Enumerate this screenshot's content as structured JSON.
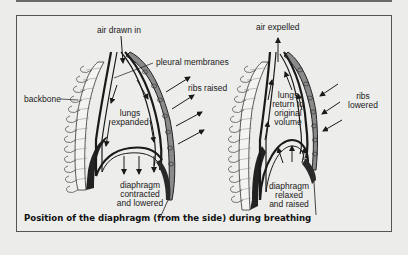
{
  "figure": {
    "caption": "Position of the diaphragm (from the side) during breathing",
    "colors": {
      "background": "#ececea",
      "line": "#1a1a1a",
      "rib_shade": "#8a8a8a",
      "muscle": "#2a2a2a"
    }
  },
  "left_panel": {
    "state": "inhalation",
    "labels": {
      "air": "air drawn in",
      "pleural": "pleural membranes",
      "ribs": "ribs raised",
      "backbone": "backbone",
      "lungs_1": "lungs",
      "lungs_2": "expanded",
      "diaphragm_1": "diaphragm",
      "diaphragm_2": "contracted",
      "diaphragm_3": "and lowered"
    }
  },
  "right_panel": {
    "state": "exhalation",
    "labels": {
      "air": "air expelled",
      "ribs_1": "ribs",
      "ribs_2": "lowered",
      "lungs_1": "lungs",
      "lungs_2": "return to",
      "lungs_3": "original",
      "lungs_4": "volume",
      "diaphragm_1": "diaphragm",
      "diaphragm_2": "relaxed",
      "diaphragm_3": "and raised"
    }
  }
}
